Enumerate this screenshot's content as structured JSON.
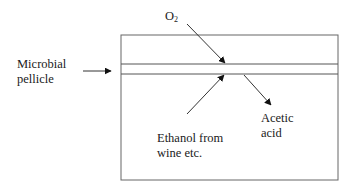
{
  "diagram": {
    "labels": {
      "oxygen": {
        "main": "O",
        "subscript": "2"
      },
      "pellicle": {
        "line1": "Microbial",
        "line2": "pellicle"
      },
      "ethanol": {
        "line1": "Ethanol from",
        "line2": "wine etc."
      },
      "acetic_acid": {
        "line1": "Acetic",
        "line2": "acid"
      }
    },
    "elements": {
      "vessel": "container box",
      "pellicle_layer": "two horizontal lines near top of vessel",
      "arrows": [
        {
          "from": "O2",
          "to": "pellicle (top)"
        },
        {
          "from": "Microbial pellicle label",
          "to": "pellicle layer"
        },
        {
          "from": "Ethanol from wine etc.",
          "to": "pellicle (bottom)"
        },
        {
          "from": "pellicle",
          "to": "Acetic acid"
        }
      ]
    },
    "colors": {
      "line": "#555555",
      "arrowhead": "#111111",
      "text": "#1a1a1a",
      "background": "#ffffff"
    }
  }
}
